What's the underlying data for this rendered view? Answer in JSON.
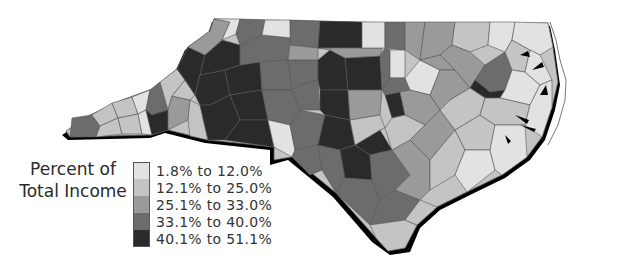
{
  "map": {
    "region": "North Carolina",
    "legend_title_line1": "Percent of",
    "legend_title_line2": "Total Income",
    "classes": [
      {
        "label": "1.8% to 12.0%",
        "color": "#e2e2e2"
      },
      {
        "label": "12.1% to 25.0%",
        "color": "#c4c4c4"
      },
      {
        "label": "25.1% to 33.0%",
        "color": "#9a9a9a"
      },
      {
        "label": "33.1% to 40.0%",
        "color": "#6c6c6c"
      },
      {
        "label": "40.1% to 51.1%",
        "color": "#2a2a2a"
      }
    ],
    "shadow_color": "#000000",
    "border_color": "#555555"
  }
}
